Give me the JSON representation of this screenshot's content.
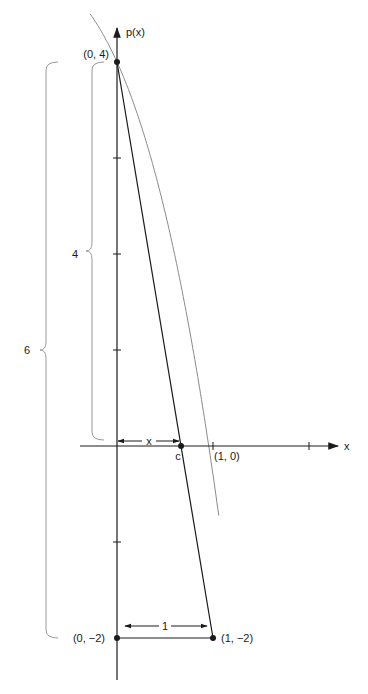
{
  "diagram": {
    "axes": {
      "x_label": "x",
      "y_label": "p(x)"
    },
    "points": [
      {
        "id": "p0",
        "label": "(0, 4)",
        "x": 0,
        "y": 4
      },
      {
        "id": "p1",
        "label": "(0, −2)",
        "x": 0,
        "y": -2
      },
      {
        "id": "p2",
        "label": "(1, −2)",
        "x": 1,
        "y": -2
      },
      {
        "id": "c",
        "label": "c",
        "x": 0.667,
        "y": 0
      }
    ],
    "x_axis_marks": [
      {
        "label": "(1, 0)",
        "x": 1
      },
      {
        "label": "",
        "x": 2
      }
    ],
    "y_ticks": [
      3,
      2,
      1,
      -1
    ],
    "braces": [
      {
        "label": "6",
        "from": -2,
        "to": 4,
        "meaning": "vertical distance from (0,-2) to (0,4)"
      },
      {
        "label": "4",
        "from": 0,
        "to": 4,
        "meaning": "vertical distance from (0,0) to (0,4)"
      }
    ],
    "dimensions": [
      {
        "label": "x",
        "from": 0,
        "to": 0.667,
        "meaning": "distance from origin to c"
      },
      {
        "label": "1",
        "from": 0,
        "to": 1,
        "meaning": "horizontal distance at y = -2"
      }
    ],
    "curve": {
      "name": "p(x)",
      "color": "#8a8a8a"
    },
    "secant": {
      "name": "secant from (0,4) to (1,-2)",
      "color": "#1a1a1a"
    }
  }
}
